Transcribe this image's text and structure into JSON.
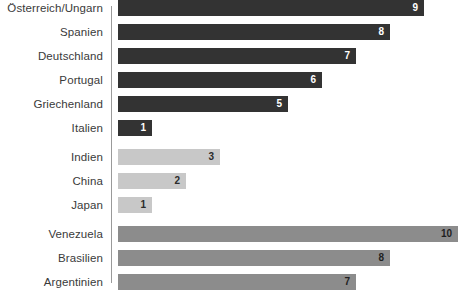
{
  "chart_data": {
    "type": "bar",
    "orientation": "horizontal",
    "title": "",
    "xlabel": "",
    "ylabel": "",
    "xlim": [
      0,
      10
    ],
    "grid": false,
    "legend": "none",
    "categories": [
      "Österreich/Ungarn",
      "Spanien",
      "Deutschland",
      "Portugal",
      "Griechenland",
      "Italien",
      "Indien",
      "China",
      "Japan",
      "Venezuela",
      "Brasilien",
      "Argentinien"
    ],
    "values": [
      9,
      8,
      7,
      6,
      5,
      1,
      3,
      2,
      1,
      10,
      8,
      7
    ],
    "groups": [
      {
        "name": "europa",
        "color": "#333333",
        "value_label_color": "#ffffff",
        "bars": [
          {
            "label": "Österreich/Ungarn",
            "value": 9,
            "value_text": "9"
          },
          {
            "label": "Spanien",
            "value": 8,
            "value_text": "8"
          },
          {
            "label": "Deutschland",
            "value": 7,
            "value_text": "7"
          },
          {
            "label": "Portugal",
            "value": 6,
            "value_text": "6"
          },
          {
            "label": "Griechenland",
            "value": 5,
            "value_text": "5"
          },
          {
            "label": "Italien",
            "value": 1,
            "value_text": "1"
          }
        ]
      },
      {
        "name": "asien",
        "color": "#c8c8c8",
        "value_label_color": "#2b2b2b",
        "bars": [
          {
            "label": "Indien",
            "value": 3,
            "value_text": "3"
          },
          {
            "label": "China",
            "value": 2,
            "value_text": "2"
          },
          {
            "label": "Japan",
            "value": 1,
            "value_text": "1"
          }
        ]
      },
      {
        "name": "suedamerika",
        "color": "#8c8c8c",
        "value_label_color": "#1f1f1f",
        "bars": [
          {
            "label": "Venezuela",
            "value": 10,
            "value_text": "10"
          },
          {
            "label": "Brasilien",
            "value": 8,
            "value_text": "8"
          },
          {
            "label": "Argentinien",
            "value": 7,
            "value_text": "7"
          }
        ]
      }
    ]
  },
  "scale": {
    "px_per_unit": 34,
    "bar_origin_x": 118,
    "axis_x": 111
  },
  "colors": {
    "background": "#ffffff",
    "axis": "#9a9a9a",
    "label_text": "#3a3a3a",
    "group_dark": "#333333",
    "group_light": "#c8c8c8",
    "group_medium": "#8c8c8c"
  }
}
